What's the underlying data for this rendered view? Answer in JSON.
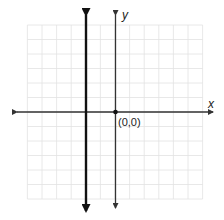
{
  "diagram": {
    "type": "coordinate-plane",
    "grid": {
      "columns": 12,
      "rows": 12,
      "x_range": [
        -6,
        6
      ],
      "y_range": [
        -6,
        6
      ]
    },
    "axes": {
      "x_label": "x",
      "y_label": "y"
    },
    "origin": {
      "label": "(0,0)"
    },
    "vertical_line": {
      "x": -2,
      "style": "bold",
      "arrows": "both"
    },
    "colors": {
      "grid": "#e2e2e2",
      "axes": "#333333",
      "bold_line": "#111111"
    }
  }
}
